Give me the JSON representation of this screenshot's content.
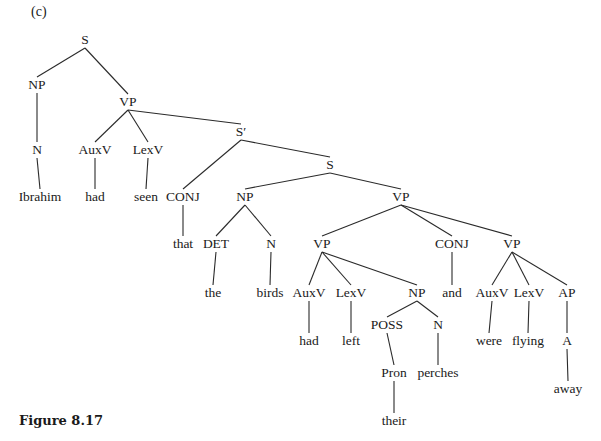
{
  "panel_label": "(c)",
  "caption": "Figure 8.17",
  "tree": {
    "nodes": [
      {
        "id": "s_root",
        "label": "S",
        "x": 85,
        "y": 40
      },
      {
        "id": "np1",
        "label": "NP",
        "x": 37,
        "y": 85
      },
      {
        "id": "vp1",
        "label": "VP",
        "x": 128,
        "y": 102
      },
      {
        "id": "n1",
        "label": "N",
        "x": 37,
        "y": 150
      },
      {
        "id": "auxv1",
        "label": "AuxV",
        "x": 95,
        "y": 150
      },
      {
        "id": "lexv1",
        "label": "LexV",
        "x": 148,
        "y": 150
      },
      {
        "id": "w_ibrahim",
        "label": "Ibrahim",
        "x": 40,
        "y": 197
      },
      {
        "id": "w_had1",
        "label": "had",
        "x": 95,
        "y": 197
      },
      {
        "id": "w_seen",
        "label": "seen",
        "x": 146,
        "y": 197
      },
      {
        "id": "sbar",
        "label": "S′",
        "x": 241,
        "y": 132
      },
      {
        "id": "conj1",
        "label": "CONJ",
        "x": 183,
        "y": 197
      },
      {
        "id": "s2",
        "label": "S",
        "x": 330,
        "y": 165
      },
      {
        "id": "np2",
        "label": "NP",
        "x": 245,
        "y": 197
      },
      {
        "id": "vp2",
        "label": "VP",
        "x": 401,
        "y": 197
      },
      {
        "id": "w_that",
        "label": "that",
        "x": 183,
        "y": 244
      },
      {
        "id": "det",
        "label": "DET",
        "x": 216,
        "y": 244
      },
      {
        "id": "n2",
        "label": "N",
        "x": 271,
        "y": 244
      },
      {
        "id": "vp3",
        "label": "VP",
        "x": 322,
        "y": 244
      },
      {
        "id": "conj2",
        "label": "CONJ",
        "x": 452,
        "y": 244
      },
      {
        "id": "vp4",
        "label": "VP",
        "x": 512,
        "y": 244
      },
      {
        "id": "w_the",
        "label": "the",
        "x": 213,
        "y": 293
      },
      {
        "id": "w_birds",
        "label": "birds",
        "x": 270,
        "y": 293
      },
      {
        "id": "auxv2",
        "label": "AuxV",
        "x": 309,
        "y": 293
      },
      {
        "id": "lexv2",
        "label": "LexV",
        "x": 351,
        "y": 293
      },
      {
        "id": "np3",
        "label": "NP",
        "x": 417,
        "y": 293
      },
      {
        "id": "w_and",
        "label": "and",
        "x": 452,
        "y": 293
      },
      {
        "id": "auxv3",
        "label": "AuxV",
        "x": 492,
        "y": 293
      },
      {
        "id": "lexv3",
        "label": "LexV",
        "x": 529,
        "y": 293
      },
      {
        "id": "ap",
        "label": "AP",
        "x": 567,
        "y": 293
      },
      {
        "id": "w_had2",
        "label": "had",
        "x": 309,
        "y": 341
      },
      {
        "id": "w_left",
        "label": "left",
        "x": 351,
        "y": 341
      },
      {
        "id": "poss",
        "label": "POSS",
        "x": 387,
        "y": 325
      },
      {
        "id": "n3",
        "label": "N",
        "x": 438,
        "y": 325
      },
      {
        "id": "w_were",
        "label": "were",
        "x": 489,
        "y": 341
      },
      {
        "id": "w_flying",
        "label": "flying",
        "x": 528,
        "y": 341
      },
      {
        "id": "a",
        "label": "A",
        "x": 567,
        "y": 341
      },
      {
        "id": "pron",
        "label": "Pron",
        "x": 394,
        "y": 373
      },
      {
        "id": "w_perches",
        "label": "perches",
        "x": 438,
        "y": 373
      },
      {
        "id": "w_away",
        "label": "away",
        "x": 568,
        "y": 389
      },
      {
        "id": "w_their",
        "label": "their",
        "x": 394,
        "y": 421
      }
    ],
    "edges": [
      [
        "s_root",
        "np1"
      ],
      [
        "s_root",
        "vp1"
      ],
      [
        "np1",
        "n1"
      ],
      [
        "n1",
        "w_ibrahim"
      ],
      [
        "vp1",
        "auxv1"
      ],
      [
        "vp1",
        "lexv1"
      ],
      [
        "vp1",
        "sbar"
      ],
      [
        "auxv1",
        "w_had1"
      ],
      [
        "lexv1",
        "w_seen"
      ],
      [
        "sbar",
        "conj1"
      ],
      [
        "sbar",
        "s2"
      ],
      [
        "conj1",
        "w_that"
      ],
      [
        "s2",
        "np2"
      ],
      [
        "s2",
        "vp2"
      ],
      [
        "np2",
        "det"
      ],
      [
        "np2",
        "n2"
      ],
      [
        "det",
        "w_the"
      ],
      [
        "n2",
        "w_birds"
      ],
      [
        "vp2",
        "vp3"
      ],
      [
        "vp2",
        "conj2"
      ],
      [
        "vp2",
        "vp4"
      ],
      [
        "vp3",
        "auxv2"
      ],
      [
        "vp3",
        "lexv2"
      ],
      [
        "vp3",
        "np3"
      ],
      [
        "auxv2",
        "w_had2"
      ],
      [
        "lexv2",
        "w_left"
      ],
      [
        "np3",
        "poss"
      ],
      [
        "np3",
        "n3"
      ],
      [
        "poss",
        "pron"
      ],
      [
        "pron",
        "w_their"
      ],
      [
        "n3",
        "w_perches"
      ],
      [
        "conj2",
        "w_and"
      ],
      [
        "vp4",
        "auxv3"
      ],
      [
        "vp4",
        "lexv3"
      ],
      [
        "vp4",
        "ap"
      ],
      [
        "auxv3",
        "w_were"
      ],
      [
        "lexv3",
        "w_flying"
      ],
      [
        "ap",
        "a"
      ],
      [
        "a",
        "w_away"
      ]
    ]
  },
  "colors": {
    "text": "#1a1a1a",
    "line": "#2a2a2a",
    "background": "#ffffff"
  }
}
